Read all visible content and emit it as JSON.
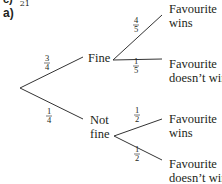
{
  "clipped_header": {
    "letter": "c)",
    "value": "21"
  },
  "part_label": "a)",
  "tree": {
    "level1": [
      {
        "label": "Fine",
        "probability": {
          "num": "3",
          "den": "4"
        }
      },
      {
        "label_line1": "Not",
        "label_line2": "fine",
        "probability": {
          "num": "1",
          "den": "4"
        }
      }
    ],
    "level2_fine": [
      {
        "label_line1": "Favourite",
        "label_line2": "wins",
        "probability": {
          "num": "4",
          "den": "5"
        }
      },
      {
        "label_line1": "Favourite",
        "label_line2": "doesn’t win",
        "probability": {
          "num": "1",
          "den": "5"
        }
      }
    ],
    "level2_notfine": [
      {
        "label_line1": "Favourite",
        "label_line2": "wins",
        "probability": {
          "num": "1",
          "den": "2"
        }
      },
      {
        "label_line1": "Favourite",
        "label_line2": "doesn’t win",
        "probability": {
          "num": "1",
          "den": "2"
        }
      }
    ]
  }
}
